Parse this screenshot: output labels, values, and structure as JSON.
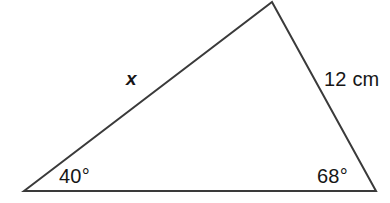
{
  "figure": {
    "type": "triangle-diagram",
    "background_color": "#ffffff",
    "stroke_color": "#3a3a3a",
    "stroke_width": 2,
    "text_color": "#161616"
  },
  "vertices": {
    "left": {
      "name": "left-vertex",
      "x": 24,
      "y": 191
    },
    "apex": {
      "name": "apex-vertex",
      "x": 272,
      "y": 2
    },
    "right": {
      "name": "right-vertex",
      "x": 376,
      "y": 191
    }
  },
  "sides": {
    "left_side": {
      "label": "x",
      "from": "left",
      "to": "apex",
      "known": false
    },
    "right_side": {
      "label": "12 cm",
      "from": "apex",
      "to": "right",
      "known": true,
      "value": 12,
      "unit": "cm"
    },
    "base": {
      "label": "",
      "from": "left",
      "to": "right",
      "known": false
    }
  },
  "angles": {
    "left_angle": {
      "label": "40°",
      "value": 40,
      "unit": "degrees"
    },
    "right_angle": {
      "label": "68°",
      "value": 68,
      "unit": "degrees"
    }
  },
  "chart_data": {
    "type": "diagram",
    "title": "",
    "shape": "triangle",
    "points": [
      {
        "id": "A",
        "x": 24,
        "y": 191,
        "role": "left vertex"
      },
      {
        "id": "B",
        "x": 272,
        "y": 2,
        "role": "apex"
      },
      {
        "id": "C",
        "x": 376,
        "y": 191,
        "role": "right vertex"
      }
    ],
    "edge_labels": [
      "x",
      "12 cm",
      ""
    ],
    "angle_labels": [
      "40°",
      "68°"
    ]
  }
}
